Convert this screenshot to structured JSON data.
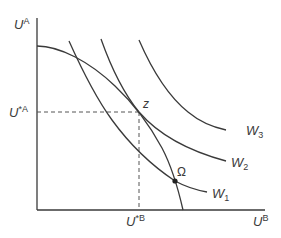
{
  "diagram": {
    "type": "welfare-economics utility possibility frontier with social indifference curves",
    "axes": {
      "y_label_main": "U",
      "y_label_sup": "A",
      "x_label_main": "U",
      "x_label_sup": "B"
    },
    "reference_lines": {
      "u_star_a_main": "U",
      "u_star_a_sup": "*A",
      "u_star_b_main": "U",
      "u_star_b_sup": "*B"
    },
    "points": {
      "z_label": "z",
      "omega_label": "Ω"
    },
    "curves": {
      "w1_main": "W",
      "w1_sub": "1",
      "w2_main": "W",
      "w2_sub": "2",
      "w3_main": "W",
      "w3_sub": "3"
    },
    "colors": {
      "line": "#3a3a3a",
      "dashed": "#555555",
      "background": "#ffffff"
    }
  }
}
